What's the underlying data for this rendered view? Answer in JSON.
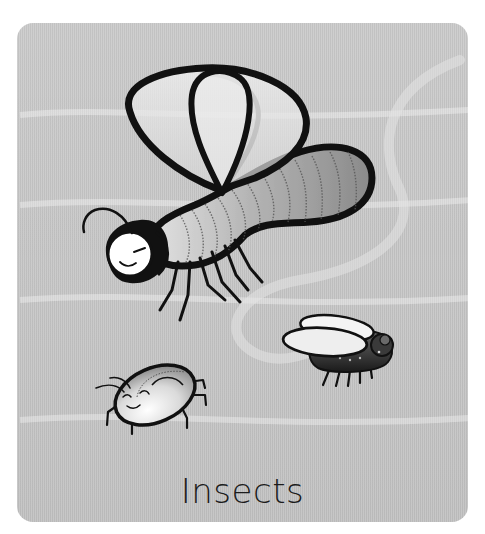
{
  "card": {
    "caption": "Insects",
    "background_color": "#c7c7c7",
    "corner_radius_px": 16
  },
  "illustration": {
    "subjects": [
      {
        "name": "large-fly",
        "description": "winged insect with segmented gray abdomen, smiling face"
      },
      {
        "name": "small-fly",
        "description": "small dark housefly with white wings"
      },
      {
        "name": "beetle",
        "description": "round smiling beetle with antennae and six legs"
      }
    ],
    "decoration": "faint light swirl trail"
  },
  "colors": {
    "outline": "#111111",
    "wing_fill": "#e6e6e6",
    "abdomen_dark": "#8e8e8e",
    "abdomen_light": "#d8d8d8",
    "text": "#1c1c1c"
  }
}
